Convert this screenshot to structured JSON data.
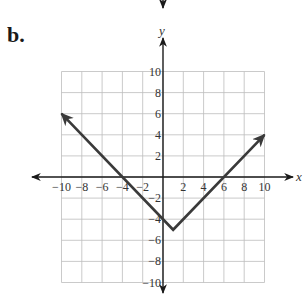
{
  "problem_label": "b.",
  "chart_data": {
    "type": "line",
    "title": "",
    "xlabel": "x",
    "ylabel": "y",
    "xlim": [
      -10,
      10
    ],
    "ylim": [
      -10,
      10
    ],
    "grid": true,
    "x_ticks": [
      -10,
      -8,
      -6,
      -4,
      -2,
      2,
      4,
      6,
      8,
      10
    ],
    "y_ticks": [
      10,
      8,
      6,
      4,
      2,
      -2,
      -4,
      -6,
      -8,
      -10
    ],
    "x_tick_labels": [
      "−10",
      "−8",
      "−6",
      "−4",
      "−2",
      "2",
      "4",
      "6",
      "8",
      "10"
    ],
    "y_tick_labels": [
      "10",
      "8",
      "6",
      "4",
      "2",
      "−2",
      "−4",
      "−6",
      "−8",
      "−10"
    ],
    "series": [
      {
        "name": "y = |x - 1| - 5",
        "points": [
          [
            -10,
            6
          ],
          [
            1,
            -5
          ],
          [
            10,
            4
          ]
        ],
        "x": [
          -10,
          -4,
          1,
          6,
          10
        ],
        "y": [
          6,
          0,
          -5,
          0,
          4
        ],
        "arrows_at_ends": true,
        "color": "#3a3a3a"
      }
    ],
    "vertex": [
      1,
      -5
    ],
    "x_intercepts": [
      -4,
      6
    ],
    "y_intercept": -4
  }
}
